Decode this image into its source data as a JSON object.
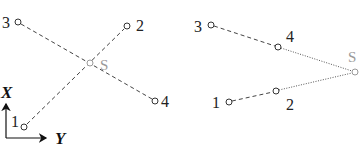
{
  "left_panel": {
    "points": [
      {
        "id": "1",
        "label": "1",
        "x": 24,
        "y": 127
      },
      {
        "id": "2",
        "label": "2",
        "x": 127,
        "y": 26
      },
      {
        "id": "3",
        "label": "3",
        "x": 18,
        "y": 22
      },
      {
        "id": "4",
        "label": "4",
        "x": 155,
        "y": 101
      },
      {
        "id": "S",
        "label": "S",
        "x": 90,
        "y": 63
      }
    ],
    "axes": {
      "x_label": "X",
      "y_label": "Y"
    }
  },
  "right_panel": {
    "points": [
      {
        "id": "1",
        "label": "1",
        "x": 229,
        "y": 102
      },
      {
        "id": "2",
        "label": "2",
        "x": 276,
        "y": 91
      },
      {
        "id": "3",
        "label": "3",
        "x": 211,
        "y": 25
      },
      {
        "id": "4",
        "label": "4",
        "x": 278,
        "y": 47
      },
      {
        "id": "S",
        "label": "S",
        "x": 355,
        "y": 72
      }
    ]
  },
  "colors": {
    "line": "#444444",
    "source": "#9a9a9a",
    "text": "#222222"
  }
}
